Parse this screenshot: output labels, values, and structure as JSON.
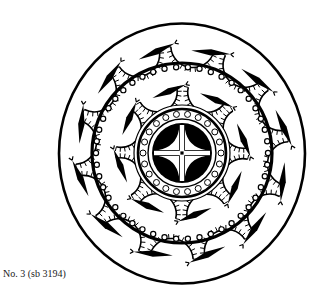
{
  "figure": {
    "colors": {
      "ink": "#000000",
      "paper": "#ffffff"
    },
    "center": [
      182,
      153
    ],
    "rings": {
      "outer_radius": 127,
      "middle_scalloped_radius": 90,
      "inner_scalloped_radius": 44,
      "core_radius": 30
    },
    "motif_counts": {
      "outer_band": 12,
      "middle_band": 8
    }
  },
  "caption": {
    "text": "No. 3 (sb 3194)"
  }
}
